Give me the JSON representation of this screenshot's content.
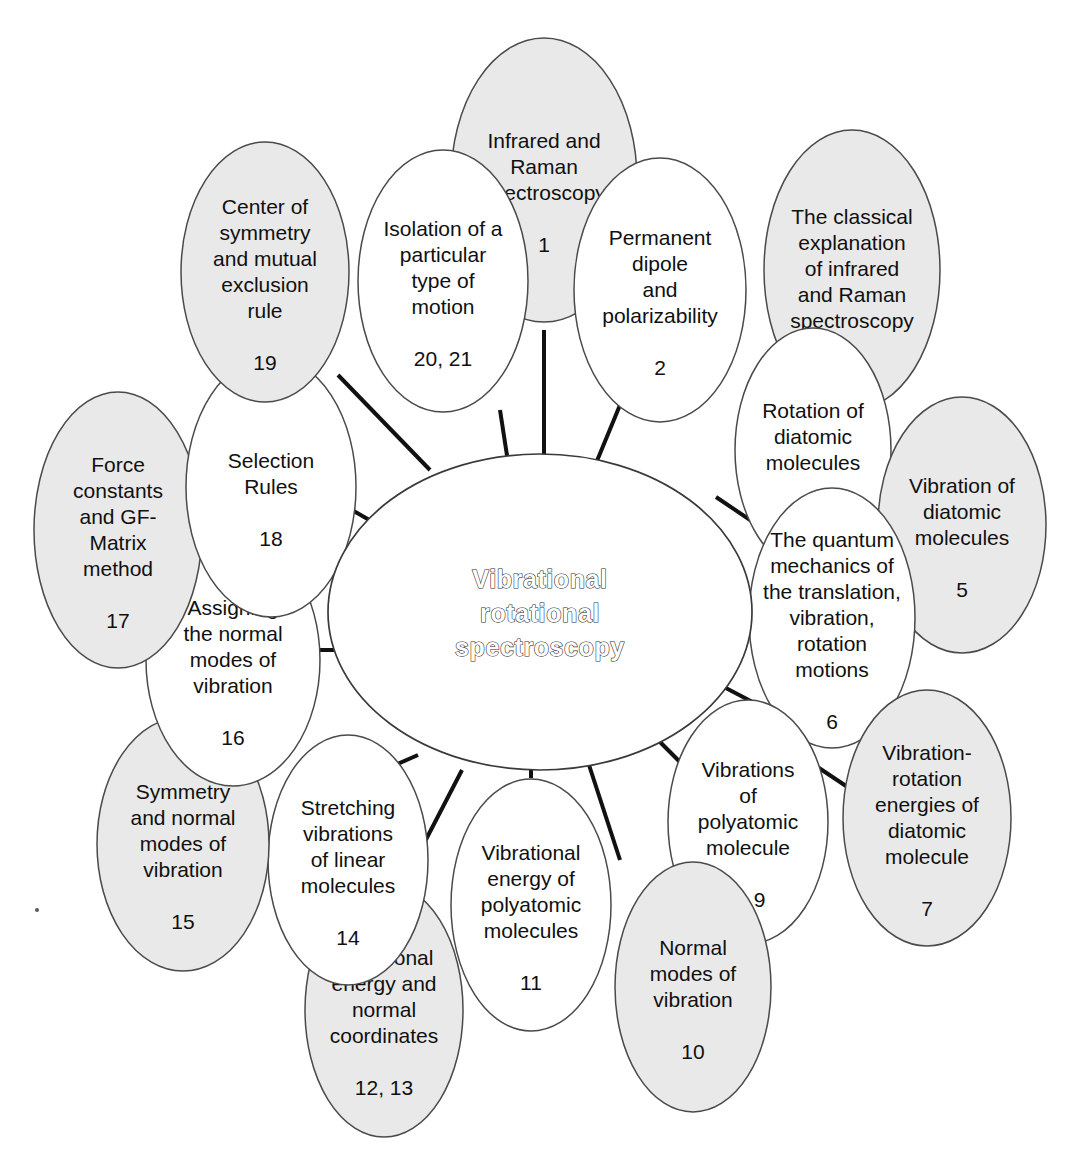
{
  "diagram": {
    "type": "mind-map",
    "title": "Vibrational rotational spectroscopy",
    "center": {
      "label": "Vibrational rotational spectroscopy",
      "line1": "Vibrational",
      "line2": "rotational",
      "line3": "spectroscopy",
      "fill": "#ffffff",
      "stroke": "#3a3a3a"
    },
    "colors": {
      "shaded_fill": "#e9e9e9",
      "plain_fill": "#ffffff",
      "outline": "#4a4a4a",
      "connector": "#111111",
      "text": "#101010"
    },
    "nodes": [
      {
        "id": "n1",
        "lines": [
          "Infrared and",
          "Raman",
          "spectroscopy"
        ],
        "number": "1",
        "shaded": true,
        "cx": 544,
        "cy": 180,
        "rx": 93,
        "ry": 142
      },
      {
        "id": "n2",
        "lines": [
          "Permanent",
          "dipole",
          "and",
          "polarizability"
        ],
        "number": "2",
        "shaded": false,
        "cx": 660,
        "cy": 290,
        "rx": 86,
        "ry": 132
      },
      {
        "id": "n3",
        "lines": [
          "The classical",
          "explanation",
          "of infrared",
          "and Raman",
          "spectroscopy"
        ],
        "number": "",
        "shaded": true,
        "cx": 852,
        "cy": 270,
        "rx": 88,
        "ry": 140
      },
      {
        "id": "n4",
        "lines": [
          "Rotation of",
          "diatomic",
          "molecules"
        ],
        "number": "4",
        "shaded": false,
        "cx": 813,
        "cy": 450,
        "rx": 78,
        "ry": 122
      },
      {
        "id": "n5",
        "lines": [
          "Vibration of",
          "diatomic",
          "molecules"
        ],
        "number": "5",
        "shaded": true,
        "cx": 962,
        "cy": 525,
        "rx": 84,
        "ry": 128
      },
      {
        "id": "n6",
        "lines": [
          "The quantum",
          "mechanics of",
          "the translation,",
          "vibration,",
          "rotation",
          "motions"
        ],
        "number": "6",
        "shaded": false,
        "cx": 832,
        "cy": 618,
        "rx": 83,
        "ry": 130
      },
      {
        "id": "n7",
        "lines": [
          "Vibration-",
          "rotation",
          "energies of",
          "diatomic",
          "molecule"
        ],
        "number": "7",
        "shaded": true,
        "cx": 927,
        "cy": 818,
        "rx": 84,
        "ry": 128
      },
      {
        "id": "n89",
        "lines": [
          "Vibrations",
          "of",
          "polyatomic",
          "molecule"
        ],
        "number": "8, 9",
        "shaded": false,
        "cx": 748,
        "cy": 822,
        "rx": 80,
        "ry": 122
      },
      {
        "id": "n10",
        "lines": [
          "Normal",
          "modes of",
          "vibration"
        ],
        "number": "10",
        "shaded": true,
        "cx": 693,
        "cy": 987,
        "rx": 78,
        "ry": 125
      },
      {
        "id": "n11",
        "lines": [
          "Vibrational",
          "energy of",
          "polyatomic",
          "molecules"
        ],
        "number": "11",
        "shaded": false,
        "cx": 531,
        "cy": 905,
        "rx": 80,
        "ry": 126
      },
      {
        "id": "n1213",
        "lines": [
          "Vibrational",
          "energy and",
          "normal",
          "coordinates"
        ],
        "number": "12, 13",
        "shaded": true,
        "cx": 384,
        "cy": 1010,
        "rx": 79,
        "ry": 127
      },
      {
        "id": "n14",
        "lines": [
          "Stretching",
          "vibrations",
          "of linear",
          "molecules"
        ],
        "number": "14",
        "shaded": false,
        "cx": 348,
        "cy": 860,
        "rx": 80,
        "ry": 125
      },
      {
        "id": "n15",
        "lines": [
          "Symmetry",
          "and normal",
          "modes of",
          "vibration"
        ],
        "number": "15",
        "shaded": true,
        "cx": 183,
        "cy": 844,
        "rx": 86,
        "ry": 127
      },
      {
        "id": "n16",
        "lines": [
          "Assigning",
          "the normal",
          "modes of",
          "vibration"
        ],
        "number": "16",
        "shaded": false,
        "cx": 233,
        "cy": 660,
        "rx": 87,
        "ry": 126
      },
      {
        "id": "n17",
        "lines": [
          "Force",
          "constants",
          "and GF-",
          "Matrix",
          "method"
        ],
        "number": "17",
        "shaded": true,
        "cx": 118,
        "cy": 530,
        "rx": 84,
        "ry": 138
      },
      {
        "id": "n18",
        "lines": [
          "Selection",
          "Rules"
        ],
        "number": "18",
        "shaded": false,
        "cx": 271,
        "cy": 487,
        "rx": 85,
        "ry": 130
      },
      {
        "id": "n19",
        "lines": [
          "Center of",
          "symmetry",
          "and mutual",
          "exclusion",
          "rule"
        ],
        "number": "19",
        "shaded": true,
        "cx": 265,
        "cy": 272,
        "rx": 84,
        "ry": 130
      },
      {
        "id": "n2021",
        "lines": [
          "Isolation of a",
          "particular",
          "type of",
          "motion"
        ],
        "number": "20, 21",
        "shaded": false,
        "cx": 443,
        "cy": 281,
        "rx": 85,
        "ry": 131
      }
    ],
    "connectors": [
      {
        "from": "n1",
        "x1": 544,
        "y1": 330,
        "x2": 544,
        "y2": 455
      },
      {
        "from": "n2",
        "x1": 620,
        "y1": 405,
        "x2": 592,
        "y2": 473
      },
      {
        "from": "n3",
        "x1": 790,
        "y1": 393,
        "x2": 752,
        "y2": 455
      },
      {
        "from": "n4",
        "x1": 762,
        "y1": 528,
        "x2": 716,
        "y2": 497
      },
      {
        "from": "n6",
        "x1": 764,
        "y1": 708,
        "x2": 722,
        "y2": 686
      },
      {
        "from": "n89",
        "x1": 680,
        "y1": 762,
        "x2": 660,
        "y2": 742
      },
      {
        "from": "n89b",
        "x1": 816,
        "y1": 766,
        "x2": 852,
        "y2": 790
      },
      {
        "from": "n10",
        "x1": 620,
        "y1": 860,
        "x2": 588,
        "y2": 762
      },
      {
        "from": "n11",
        "x1": 531,
        "y1": 778,
        "x2": 531,
        "y2": 745
      },
      {
        "from": "n1213",
        "x1": 405,
        "y1": 880,
        "x2": 462,
        "y2": 770
      },
      {
        "from": "n14",
        "x1": 338,
        "y1": 790,
        "x2": 418,
        "y2": 755
      },
      {
        "from": "n16",
        "x1": 312,
        "y1": 650,
        "x2": 348,
        "y2": 650
      },
      {
        "from": "n17",
        "x1": 196,
        "y1": 572,
        "x2": 228,
        "y2": 585
      },
      {
        "from": "n18",
        "x1": 352,
        "y1": 510,
        "x2": 378,
        "y2": 525
      },
      {
        "from": "n19",
        "x1": 338,
        "y1": 375,
        "x2": 430,
        "y2": 470
      },
      {
        "from": "n2021",
        "x1": 500,
        "y1": 410,
        "x2": 508,
        "y2": 462
      }
    ],
    "speck": {
      "x": 35,
      "y": 908
    }
  }
}
